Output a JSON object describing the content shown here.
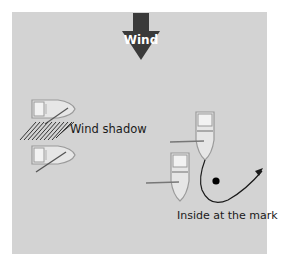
{
  "diagram": {
    "wind_arrow": {
      "label": "Wind",
      "color": "#3a3a3a",
      "label_color": "#ffffff"
    },
    "wind_shadow": {
      "label": "Wind shadow"
    },
    "inside_at_mark": {
      "label": "Inside at the mark"
    },
    "colors": {
      "panel": "#d3d3d3",
      "boat_hull": "#e6e6e6",
      "boat_outline": "#9a9a9a",
      "line": "#1a1a1a",
      "mark": "#000000"
    }
  }
}
